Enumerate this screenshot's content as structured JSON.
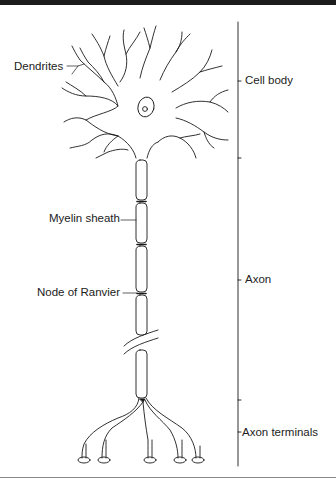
{
  "diagram": {
    "left_labels": [
      {
        "id": "dendrites",
        "text": "Dendrites"
      },
      {
        "id": "myelin_sheath",
        "text": "Myelin sheath"
      },
      {
        "id": "node_of_ranvier",
        "text": "Node of Ranvier"
      }
    ],
    "right_labels": [
      {
        "id": "cell_body",
        "text": "Cell body"
      },
      {
        "id": "axon",
        "text": "Axon"
      },
      {
        "id": "axon_terminals",
        "text": "Axon terminals"
      }
    ],
    "colors": {
      "line": "#1a1a1a",
      "background": "#ffffff",
      "top_band": "#1c1c1c"
    }
  }
}
